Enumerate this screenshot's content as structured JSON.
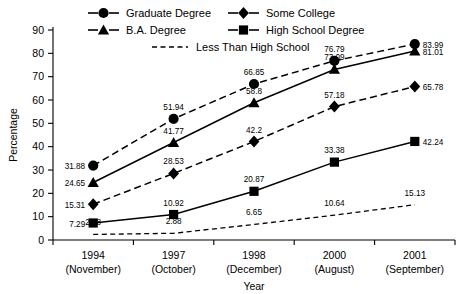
{
  "chart_data": {
    "type": "line",
    "title": "",
    "xlabel": "Year",
    "ylabel": "Percentage",
    "ylim": [
      0,
      90
    ],
    "ytick_step": 10,
    "yticks": [
      0,
      10,
      20,
      30,
      40,
      50,
      60,
      70,
      80,
      90
    ],
    "grid": false,
    "legend_position": "top",
    "categories": [
      "1994\n(November)",
      "1997\n(October)",
      "1998\n(December)",
      "2000\n(August)",
      "2001\n(September)"
    ],
    "category_years": [
      "1994",
      "1997",
      "1998",
      "2000",
      "2001"
    ],
    "category_months": [
      "(November)",
      "(October)",
      "(December)",
      "(August)",
      "(September)"
    ],
    "series": [
      {
        "name": "Graduate Degree",
        "marker": "circle",
        "linestyle": "dashed",
        "color": "#000000",
        "values": [
          31.88,
          51.94,
          66.85,
          76.79,
          83.99
        ],
        "labels": [
          "31.88",
          "51.94",
          "66.85",
          "76.79",
          "83.99"
        ]
      },
      {
        "name": "B.A. Degree",
        "marker": "triangle",
        "linestyle": "solid",
        "color": "#000000",
        "values": [
          24.65,
          41.77,
          58.8,
          73.09,
          81.01
        ],
        "labels": [
          "24.65",
          "41.77",
          "58.8",
          "73.09",
          "81.01"
        ]
      },
      {
        "name": "Some College",
        "marker": "diamond",
        "linestyle": "dashed",
        "color": "#000000",
        "values": [
          15.31,
          28.53,
          42.2,
          57.18,
          65.78
        ],
        "labels": [
          "15.31",
          "28.53",
          "42.2",
          "57.18",
          "65.78"
        ]
      },
      {
        "name": "High School Degree",
        "marker": "square",
        "linestyle": "solid",
        "color": "#000000",
        "values": [
          7.29,
          10.92,
          20.87,
          33.38,
          42.24
        ],
        "labels": [
          "7.29",
          "10.92",
          "20.87",
          "33.38",
          "42.24"
        ]
      },
      {
        "name": "Less Than High School",
        "marker": "none",
        "linestyle": "fine-dashed",
        "color": "#000000",
        "values": [
          2.38,
          2.88,
          6.65,
          10.64,
          15.13
        ],
        "labels": [
          "2.38",
          "2.88",
          "6.65",
          "10.64",
          "15.13"
        ]
      }
    ]
  },
  "legend": {
    "entries": [
      {
        "label": "Graduate Degree",
        "marker": "circle",
        "linestyle": "solid"
      },
      {
        "label": "Some College",
        "marker": "diamond",
        "linestyle": "solid"
      },
      {
        "label": "B.A. Degree",
        "marker": "triangle",
        "linestyle": "solid"
      },
      {
        "label": "High School Degree",
        "marker": "square",
        "linestyle": "solid"
      },
      {
        "label": "Less Than High School",
        "marker": "none",
        "linestyle": "dashed"
      }
    ]
  },
  "axes": {
    "y_title": "Percentage",
    "x_title": "Year"
  }
}
